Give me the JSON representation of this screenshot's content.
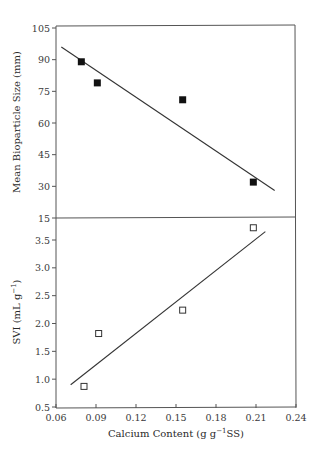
{
  "chart_data": [
    {
      "type": "scatter",
      "panel": "top",
      "title": "",
      "xlabel": "Calcium Content (g g⁻¹SS)",
      "ylabel": "Mean Bioparticle Size (mm)",
      "xlim": [
        0.06,
        0.24
      ],
      "ylim": [
        15,
        105
      ],
      "x_ticks": [
        "0.06",
        "0.09",
        "0.12",
        "0.15",
        "0.18",
        "0.21",
        "0.24"
      ],
      "y_ticks": [
        "105",
        "90",
        "75",
        "60",
        "45",
        "30",
        "15"
      ],
      "grid": false,
      "series": [
        {
          "name": "Mean bioparticle size",
          "marker": "filled-square",
          "x": [
            0.079,
            0.091,
            0.155,
            0.208
          ],
          "y": [
            89,
            79,
            71,
            32
          ]
        }
      ],
      "trendline": {
        "x": [
          0.064,
          0.224
        ],
        "y": [
          96,
          28
        ]
      }
    },
    {
      "type": "scatter",
      "panel": "bottom",
      "title": "",
      "xlabel": "Calcium Content (g g⁻¹SS)",
      "ylabel": "SVI (mL g⁻¹)",
      "xlim": [
        0.06,
        0.24
      ],
      "ylim": [
        0.5,
        3.75
      ],
      "x_ticks": [
        "0.06",
        "0.09",
        "0.12",
        "0.15",
        "0.18",
        "0.21",
        "0.24"
      ],
      "y_ticks": [
        "3.5",
        "3.0",
        "2.5",
        "2.0",
        "1.5",
        "1.0",
        "0.5"
      ],
      "grid": false,
      "series": [
        {
          "name": "SVI",
          "marker": "open-square",
          "x": [
            0.081,
            0.092,
            0.155,
            0.208
          ],
          "y": [
            0.87,
            1.82,
            2.24,
            3.72
          ]
        }
      ],
      "trendline": {
        "x": [
          0.071,
          0.217
        ],
        "y": [
          0.9,
          3.65
        ]
      }
    }
  ],
  "labels": {
    "top_ylabel": "Mean Bioparticle Size (mm)",
    "bottom_ylabel_main": "SVI (mL g",
    "bottom_ylabel_sup": "−1",
    "bottom_ylabel_end": ")",
    "xlabel_main": "Calcium Content (g g",
    "xlabel_sup": "−1",
    "xlabel_end": "SS)"
  }
}
